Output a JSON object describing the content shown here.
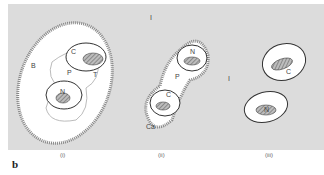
{
  "figure": {
    "panel_letter": "b",
    "panels": [
      {
        "caption": "(i)",
        "labels": {
          "boundary": "B",
          "cell_top": "C",
          "cell_bottom": "N",
          "middle": "P",
          "tissue": "T"
        }
      },
      {
        "caption": "(ii)",
        "labels": {
          "interstitial": "I",
          "cell_top": "N",
          "cell_bottom": "C",
          "middle": "P",
          "capsule": "Ca"
        }
      },
      {
        "caption": "(iii)",
        "labels": {
          "interstitial": "I",
          "cell_top": "C",
          "cell_bottom": "N"
        }
      }
    ],
    "top_label": "I"
  }
}
